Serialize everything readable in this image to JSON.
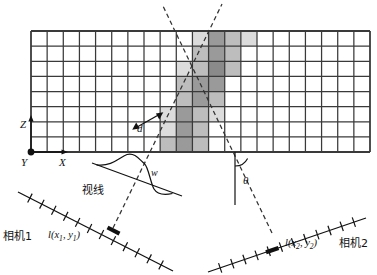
{
  "figure": {
    "type": "stereo-triangulation-voxel-grid-diagram",
    "axes": {
      "z_label": "Z",
      "x_label": "X",
      "y_label": "Y"
    },
    "annotations": {
      "distance_label": "d",
      "width_label": "w",
      "angle_label": "θ",
      "sight_line_label": "视线"
    },
    "cameras": [
      {
        "name": "相机1",
        "pixel_label_prefix": "l(",
        "pixel_label_x": "x",
        "pixel_label_x_sub": "1",
        "pixel_label_sep": ", ",
        "pixel_label_y": "y",
        "pixel_label_y_sub": "1",
        "pixel_label_suffix": ")"
      },
      {
        "name": "相机2",
        "pixel_label_prefix": "l(",
        "pixel_label_x": "x",
        "pixel_label_x_sub": "2",
        "pixel_label_sep": ", ",
        "pixel_label_y": "y",
        "pixel_label_y_sub": "2",
        "pixel_label_suffix": ")"
      }
    ],
    "grid": {
      "columns": 21,
      "rows": 8,
      "left": 31,
      "top": 31,
      "right": 370,
      "bottom": 152,
      "line_color": "#3a3a3a",
      "cell_fill_empty": "#ffffff"
    },
    "shade_colors": {
      "light": "#dcdcdc",
      "medium": "#bdbdbd",
      "dark": "#9a9a9a",
      "darkest": "#8a8a8a"
    },
    "shaded_cells": [
      {
        "col": 10,
        "row": 0,
        "shade": "light"
      },
      {
        "col": 11,
        "row": 0,
        "shade": "dark"
      },
      {
        "col": 12,
        "row": 0,
        "shade": "medium"
      },
      {
        "col": 13,
        "row": 0,
        "shade": "light"
      },
      {
        "col": 10,
        "row": 1,
        "shade": "medium"
      },
      {
        "col": 11,
        "row": 1,
        "shade": "dark"
      },
      {
        "col": 12,
        "row": 1,
        "shade": "medium"
      },
      {
        "col": 9,
        "row": 2,
        "shade": "light"
      },
      {
        "col": 10,
        "row": 2,
        "shade": "medium"
      },
      {
        "col": 11,
        "row": 2,
        "shade": "darkest"
      },
      {
        "col": 12,
        "row": 2,
        "shade": "medium"
      },
      {
        "col": 9,
        "row": 3,
        "shade": "medium"
      },
      {
        "col": 10,
        "row": 3,
        "shade": "dark"
      },
      {
        "col": 11,
        "row": 3,
        "shade": "dark"
      },
      {
        "col": 9,
        "row": 4,
        "shade": "medium"
      },
      {
        "col": 10,
        "row": 4,
        "shade": "dark"
      },
      {
        "col": 11,
        "row": 4,
        "shade": "medium"
      },
      {
        "col": 8,
        "row": 5,
        "shade": "light"
      },
      {
        "col": 9,
        "row": 5,
        "shade": "dark"
      },
      {
        "col": 10,
        "row": 5,
        "shade": "medium"
      },
      {
        "col": 11,
        "row": 5,
        "shade": "light"
      },
      {
        "col": 8,
        "row": 6,
        "shade": "light"
      },
      {
        "col": 9,
        "row": 6,
        "shade": "dark"
      },
      {
        "col": 10,
        "row": 6,
        "shade": "medium"
      },
      {
        "col": 8,
        "row": 7,
        "shade": "medium"
      },
      {
        "col": 9,
        "row": 7,
        "shade": "dark"
      },
      {
        "col": 10,
        "row": 7,
        "shade": "medium"
      }
    ],
    "rays": [
      {
        "name": "camera1-ray",
        "x1": 113,
        "y1": 228,
        "x2": 222,
        "y2": 4,
        "style": "dashed"
      },
      {
        "name": "camera2-ray",
        "x1": 272,
        "y1": 233,
        "x2": 162,
        "y2": 4,
        "style": "dashed"
      }
    ],
    "intersection": {
      "x": 188,
      "y": 45
    }
  }
}
